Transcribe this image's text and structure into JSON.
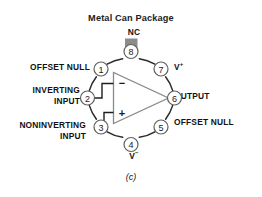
{
  "figure": {
    "title": "Metal Can Package",
    "caption": "(c)",
    "package_shape": "circle",
    "device": "operational-amplifier",
    "colors": {
      "outline": "#2b2b2b",
      "pin_circle_fill": "#ffffff",
      "pin_circle_stroke": "#5a5a5a",
      "tab_fill": "#8c8c8c",
      "triangle_stroke": "#8a8a8a",
      "text": "#111111",
      "background": "#ffffff"
    }
  },
  "pins": [
    {
      "number": "1",
      "label": "OFFSET NULL",
      "side": "left",
      "cx": 101,
      "cy": 69
    },
    {
      "number": "2",
      "label": "INVERTING\nINPUT",
      "side": "left",
      "cx": 89,
      "cy": 98
    },
    {
      "number": "3",
      "label": "NONINVERTING\nINPUT",
      "side": "left",
      "cx": 101,
      "cy": 127
    },
    {
      "number": "4",
      "label": "V⁻",
      "side": "bottom",
      "cx": 131,
      "cy": 140
    },
    {
      "number": "5",
      "label": "OFFSET NULL",
      "side": "right",
      "cx": 161,
      "cy": 127
    },
    {
      "number": "6",
      "label": "OUTPUT",
      "side": "right",
      "cx": 173,
      "cy": 98
    },
    {
      "number": "7",
      "label": "V⁺",
      "side": "right",
      "cx": 161,
      "cy": 69
    },
    {
      "number": "8",
      "label": "NC",
      "side": "top",
      "cx": 131,
      "cy": 56
    }
  ],
  "labels": {
    "nc": "NC",
    "v_minus_text": "V",
    "v_minus_sign": "−",
    "v_plus_text": "V",
    "v_plus_sign": "+",
    "offset_null_1": "OFFSET NULL",
    "inverting_input": "INVERTING\nINPUT",
    "noninverting_input": "NONINVERTING\nINPUT",
    "output": "OUTPUT",
    "offset_null_5": "OFFSET NULL",
    "minus_terminal": "−",
    "plus_terminal": "+"
  },
  "pin_numbers": {
    "p1": "1",
    "p2": "2",
    "p3": "3",
    "p4": "4",
    "p5": "5",
    "p6": "6",
    "p7": "7",
    "p8": "8"
  }
}
